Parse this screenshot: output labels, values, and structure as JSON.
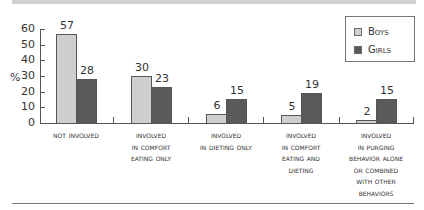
{
  "chart_data": {
    "type": "bar",
    "title": "",
    "xlabel": "",
    "ylabel": "%",
    "ylim": [
      0,
      60
    ],
    "yticks": [
      0,
      10,
      20,
      30,
      40,
      50,
      60
    ],
    "grid": false,
    "legend_position": "top-right",
    "categories": [
      "Not involved",
      "Involved in comfort eating only",
      "Involved in dieting only",
      "Involved in comfort eating and dieting",
      "Involved in purging behavior alone or combined with other behaviors"
    ],
    "series": [
      {
        "name": "Boys",
        "color": "#cfcfcf",
        "values": [
          57,
          30,
          6,
          5,
          2
        ]
      },
      {
        "name": "Girls",
        "color": "#5a5a5a",
        "values": [
          28,
          23,
          15,
          19,
          15
        ]
      }
    ]
  },
  "axis": {
    "ylabel": "%",
    "yticks": [
      "0",
      "10",
      "20",
      "30",
      "40",
      "50",
      "60"
    ]
  },
  "legend": {
    "boys": "Boys",
    "girls": "Girls"
  },
  "categories": [
    {
      "lines": [
        "Not involved"
      ],
      "boys": "57",
      "girls": "28"
    },
    {
      "lines": [
        "Involved",
        "in comfort",
        "eating only"
      ],
      "boys": "30",
      "girls": "23"
    },
    {
      "lines": [
        "Involved",
        "in dieting only"
      ],
      "boys": "6",
      "girls": "15"
    },
    {
      "lines": [
        "Involved",
        "in comfort",
        "eating and",
        "dieting"
      ],
      "boys": "5",
      "girls": "19"
    },
    {
      "lines": [
        "Involved",
        "in purging",
        "behavior alone",
        "or combined",
        "with other",
        "behaviors"
      ],
      "boys": "2",
      "girls": "15"
    }
  ]
}
